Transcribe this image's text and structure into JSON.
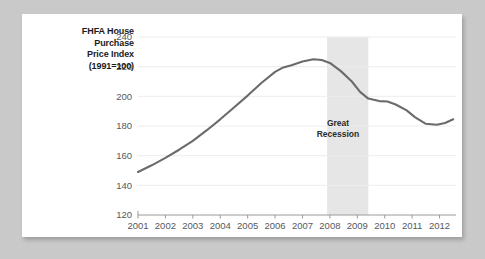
{
  "chart_data": {
    "type": "line",
    "title": "",
    "ylabel": "FHFA House Purchase Price Index (1991=100)",
    "ylabel_lines": [
      "FHFA House",
      "Purchase",
      "Price Index",
      "(1991=100)"
    ],
    "xlabel": "",
    "xlim": [
      2001,
      2012.6
    ],
    "ylim": [
      120,
      240
    ],
    "yticks": [
      120,
      140,
      160,
      180,
      200,
      220,
      240
    ],
    "xticks": [
      2001,
      2002,
      2003,
      2004,
      2005,
      2006,
      2007,
      2008,
      2009,
      2010,
      2011,
      2012
    ],
    "xtick_labels": [
      "2001",
      "2002",
      "2003",
      "2004",
      "2005",
      "2006",
      "2007",
      "2008",
      "2009",
      "2010",
      "2011",
      "2012"
    ],
    "grid": true,
    "legend": "none",
    "line_color": "#6b6b6b",
    "annotations": [
      {
        "type": "vspan",
        "label": "Great Recession",
        "label_lines": [
          "Great",
          "Recession"
        ],
        "x_start": 2007.9,
        "x_end": 2009.4,
        "color": "#e6e6e6"
      }
    ],
    "x": [
      2001.0,
      2001.5,
      2002.0,
      2002.5,
      2003.0,
      2003.5,
      2004.0,
      2004.5,
      2005.0,
      2005.5,
      2006.0,
      2006.3,
      2006.6,
      2007.0,
      2007.4,
      2007.7,
      2008.0,
      2008.4,
      2008.8,
      2009.1,
      2009.4,
      2009.8,
      2010.1,
      2010.4,
      2010.8,
      2011.1,
      2011.5,
      2011.9,
      2012.2,
      2012.5
    ],
    "y": [
      149.0,
      153.5,
      158.5,
      164.0,
      170.0,
      177.0,
      184.5,
      192.5,
      200.5,
      209.0,
      216.5,
      219.5,
      221.0,
      223.5,
      225.0,
      224.5,
      222.5,
      217.0,
      210.0,
      203.0,
      198.5,
      196.8,
      196.5,
      194.5,
      190.5,
      186.0,
      181.5,
      180.8,
      182.0,
      184.5
    ]
  }
}
